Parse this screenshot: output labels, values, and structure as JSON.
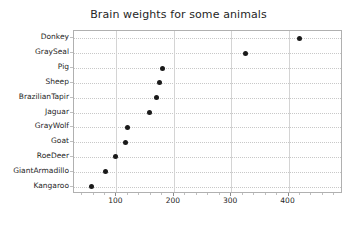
{
  "chart_data": {
    "type": "scatter",
    "title": "Brain weights for some animals",
    "xlabel": "",
    "ylabel": "",
    "categories": [
      "Donkey",
      "GraySeal",
      "Pig",
      "Sheep",
      "BrazilianTapir",
      "Jaguar",
      "GrayWolf",
      "Goat",
      "RoeDeer",
      "GiantArmadillo",
      "Kangaroo"
    ],
    "values": [
      419,
      325,
      180,
      175,
      169,
      157,
      120,
      115,
      98,
      81,
      56
    ],
    "xlim": [
      26,
      495
    ],
    "xticks": [
      100,
      200,
      300,
      400
    ],
    "xtick_labels": [
      "100",
      "200",
      "300",
      "400"
    ],
    "grid": true,
    "grid_style": "dotted-horizontal-solid-vertical",
    "legend": "none",
    "marker": "filled-circle",
    "marker_color": "#1a1a1a",
    "axes_color": "#b0b0b0",
    "text_color": "#262626",
    "background": "#ffffff"
  }
}
